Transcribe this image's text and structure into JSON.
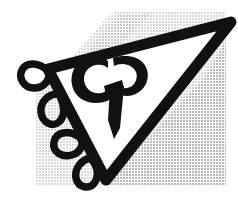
{
  "image": {
    "kind": "scanned-logo",
    "title": "CP triangle monogram logo",
    "width": 238,
    "height": 197,
    "background_color": "#ffffff",
    "ink_color": "#111111",
    "shadow_color": "#e6e6e6",
    "shadow_color_deep": "#d8d8d8",
    "paper_color": "#ffffff"
  },
  "monogram": {
    "letters": "CP",
    "style": "calligraphic-ligature",
    "color": "#111111",
    "counter_color": "#ffffff",
    "description": "Stylized script C and P joined, with a tapering downward descender wedge"
  },
  "triangle": {
    "name": "outlined-triangle",
    "orientation": "apex-down",
    "stroke_color": "#111111",
    "fill_color": "#ffffff",
    "stroke_width": 11,
    "vertices": [
      {
        "label": "left",
        "x": 48,
        "y": 69
      },
      {
        "label": "top-right",
        "x": 231,
        "y": 22
      },
      {
        "label": "bottom",
        "x": 106,
        "y": 180
      }
    ]
  },
  "flourishes": {
    "name": "teardrop-loops",
    "color": "#111111",
    "count": 4,
    "side": "left-edge",
    "loops": [
      {
        "index": 1,
        "cx": 38,
        "cy": 80,
        "angle": -28
      },
      {
        "index": 2,
        "cx": 54,
        "cy": 110,
        "angle": -8
      },
      {
        "index": 3,
        "cx": 70,
        "cy": 143,
        "angle": -30
      },
      {
        "index": 4,
        "cx": 84,
        "cy": 170,
        "angle": -6
      }
    ]
  },
  "shadow_panel": {
    "name": "halftone-shadow-panel",
    "color": "#e6e6e6",
    "texture": "halftone-dots",
    "left": 36,
    "top": 0,
    "right": 226,
    "bottom": 186
  },
  "accessibility": {
    "alt_text": "Black line-art logo: a downward pointing triangle outlined in heavy brush stroke containing a script CP monogram, with four teardrop flourishes trailing down the left side, set on a light grey halftone shadow."
  }
}
